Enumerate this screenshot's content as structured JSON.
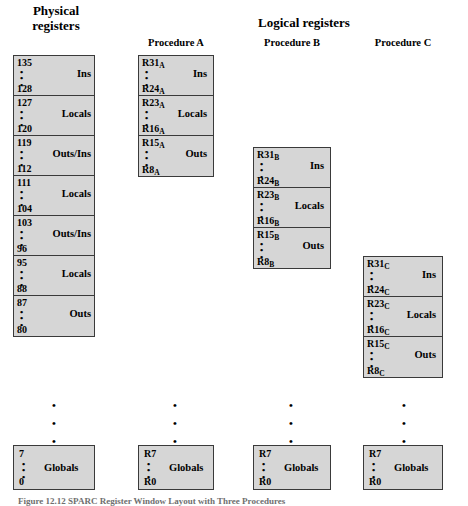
{
  "titles": {
    "physical": "Physical\nregisters",
    "logical": "Logical registers"
  },
  "column_headers": {
    "proc_a": "Procedure A",
    "proc_b": "Procedure B",
    "proc_c": "Procedure C"
  },
  "ellipsis": {
    "inline": "•\n•\n•",
    "vertical": "•\n•\n•"
  },
  "columns": {
    "physical": {
      "segments": [
        {
          "top": "135",
          "bottom": "128",
          "name": "Ins"
        },
        {
          "top": "127",
          "bottom": "120",
          "name": "Locals"
        },
        {
          "top": "119",
          "bottom": "112",
          "name": "Outs/Ins"
        },
        {
          "top": "111",
          "bottom": "104",
          "name": "Locals"
        },
        {
          "top": "103",
          "bottom": "96",
          "name": "Outs/Ins"
        },
        {
          "top": "95",
          "bottom": "88",
          "name": "Locals"
        },
        {
          "top": "87",
          "bottom": "80",
          "name": "Outs"
        }
      ],
      "globals": {
        "top": "7",
        "bottom": "0",
        "name": "Globals"
      }
    },
    "proc_a": {
      "segments": [
        {
          "top": "R31",
          "top_sub": "A",
          "bottom": "R24",
          "bottom_sub": "A",
          "name": "Ins"
        },
        {
          "top": "R23",
          "top_sub": "A",
          "bottom": "R16",
          "bottom_sub": "A",
          "name": "Locals"
        },
        {
          "top": "R15",
          "top_sub": "A",
          "bottom": "R8",
          "bottom_sub": "A",
          "name": "Outs"
        }
      ],
      "globals": {
        "top": "R7",
        "bottom": "R0",
        "name": "Globals"
      }
    },
    "proc_b": {
      "segments": [
        {
          "top": "R31",
          "top_sub": "B",
          "bottom": "R24",
          "bottom_sub": "B",
          "name": "Ins"
        },
        {
          "top": "R23",
          "top_sub": "B",
          "bottom": "R16",
          "bottom_sub": "B",
          "name": "Locals"
        },
        {
          "top": "R15",
          "top_sub": "B",
          "bottom": "R8",
          "bottom_sub": "B",
          "name": "Outs"
        }
      ],
      "globals": {
        "top": "R7",
        "bottom": "R0",
        "name": "Globals"
      }
    },
    "proc_c": {
      "segments": [
        {
          "top": "R31",
          "top_sub": "C",
          "bottom": "R24",
          "bottom_sub": "C",
          "name": "Ins"
        },
        {
          "top": "R23",
          "top_sub": "C",
          "bottom": "R16",
          "bottom_sub": "C",
          "name": "Locals"
        },
        {
          "top": "R15",
          "top_sub": "C",
          "bottom": "R8",
          "bottom_sub": "C",
          "name": "Outs"
        }
      ],
      "globals": {
        "top": "R7",
        "bottom": "R0",
        "name": "Globals"
      }
    }
  },
  "caption": "Figure 12.12   SPARC Register Window Layout with Three Procedures",
  "colors": {
    "box_fill": "#d6d6d6",
    "box_border": "#3a3a3a",
    "text": "#000000",
    "background": "#ffffff"
  }
}
